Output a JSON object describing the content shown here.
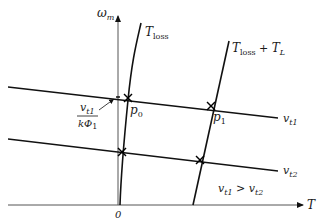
{
  "diagram": {
    "type": "torque-speed characteristic",
    "axes": {
      "y_label": "ω",
      "y_label_sub": "m",
      "x_label": "T",
      "origin_label": "0"
    },
    "curves": {
      "loss": {
        "label": "T",
        "label_sub": "loss"
      },
      "loss_plus_load": {
        "label": "T",
        "label_sub": "loss",
        "label_plus": " + ",
        "label2": "T",
        "label2_sub": "L"
      }
    },
    "lines": {
      "vt1": {
        "label": "v",
        "label_sub": "t1"
      },
      "vt2": {
        "label": "v",
        "label_sub": "t2"
      }
    },
    "points": {
      "p0": {
        "label": "p",
        "label_sub": "0"
      },
      "p1": {
        "label": "p",
        "label_sub": "1"
      }
    },
    "annotation_fraction": {
      "numerator": "v",
      "numerator_sub": "t1",
      "denominator": "kΦ",
      "denominator_sub": "1"
    },
    "condition": {
      "left": "v",
      "left_sub": "t1",
      "op": " > ",
      "right": "v",
      "right_sub": "t2"
    },
    "colors": {
      "ink": "#111111",
      "axis": "#555555",
      "background": "#ffffff"
    }
  }
}
